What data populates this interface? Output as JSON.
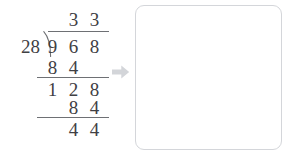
{
  "problem": {
    "type": "long-division",
    "divisor": "28",
    "dividend": "968",
    "quotient": "33",
    "remainder": "44",
    "expression": "968 ÷ 28 = 33 R 44"
  },
  "rows": {
    "quotient": {
      "d1": "3",
      "d2": "3"
    },
    "dividend": {
      "d0": "9",
      "d1": "6",
      "d2": "8"
    },
    "subtrahend1": {
      "d0": "8",
      "d1": "4"
    },
    "difference1": {
      "d0": "1",
      "d1": "2",
      "d2": "8"
    },
    "subtrahend2": {
      "d1": "8",
      "d2": "4"
    },
    "difference2": {
      "d1": "4",
      "d2": "4"
    }
  },
  "arrow": {
    "icon": "arrow-right-icon",
    "color": "#d3d5d9"
  },
  "answer_box": {
    "value": "",
    "placeholder": "",
    "border_color": "#d4d6da"
  },
  "colors": {
    "digit": "#3f4044",
    "rule": "#6e7074",
    "background": "#ffffff"
  }
}
